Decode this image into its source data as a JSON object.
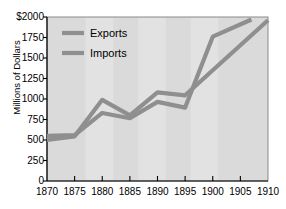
{
  "chart_data": {
    "type": "line",
    "title": "",
    "xlabel": "",
    "ylabel": "Millions of Dollars",
    "xlim": [
      1870,
      1910
    ],
    "ylim": [
      0,
      2000
    ],
    "grid": false,
    "legend_position": "upper-left",
    "x_ticks": [
      "1870",
      "1875",
      "1880",
      "1885",
      "1890",
      "1895",
      "1900",
      "1905",
      "1910"
    ],
    "y_ticks": [
      "0",
      "250",
      "500",
      "750",
      "1000",
      "1250",
      "1500",
      "1750",
      "$2000"
    ],
    "y_tick_values": [
      0,
      250,
      500,
      750,
      1000,
      1250,
      1500,
      1750,
      2000
    ],
    "series": [
      {
        "name": "Exports",
        "color": "#8f8f8f",
        "x": [
          1870,
          1875,
          1880,
          1885,
          1890,
          1895,
          1900,
          1907
        ],
        "values": [
          550,
          560,
          830,
          765,
          965,
          895,
          1760,
          1970
        ]
      },
      {
        "name": "Imports",
        "color": "#8f8f8f",
        "x": [
          1870,
          1875,
          1880,
          1885,
          1890,
          1895,
          1910
        ],
        "values": [
          500,
          545,
          990,
          800,
          1080,
          1045,
          1960
        ]
      }
    ],
    "bands": [
      {
        "from": 1870,
        "to": 1877
      },
      {
        "from": 1882,
        "to": 1886.5
      },
      {
        "from": 1891.5,
        "to": 1896
      },
      {
        "from": 1901,
        "to": 1910
      }
    ],
    "plot_background": "#e2e2e2",
    "band_color": "#dadada",
    "axis_color": "#000000"
  },
  "legend": {
    "items": [
      {
        "label": "Exports"
      },
      {
        "label": "Imports"
      }
    ]
  }
}
